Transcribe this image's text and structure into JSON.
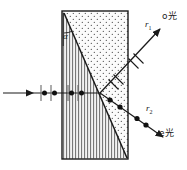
{
  "figure": {
    "type": "optics-ray-diagram",
    "colors": {
      "stroke": "#1a1a1a",
      "background": "#ffffff",
      "vertical_hatch": "#555555",
      "stipple": "#444444"
    }
  },
  "crystal": {
    "name": "birefringent-crystal",
    "left": 62,
    "top": 11,
    "right": 128,
    "bottom": 159,
    "regions": [
      {
        "name": "optic-axis-region-upper-right",
        "fill": "stipple"
      },
      {
        "name": "optic-axis-region-lower-left",
        "fill": "vertical-lines"
      }
    ],
    "diagonal": {
      "x1": 64,
      "y1": 13,
      "x2": 127,
      "y2": 158
    }
  },
  "angle": {
    "label": "α",
    "name": "angle-alpha",
    "x": 64,
    "y": 37
  },
  "incident_ray": {
    "name": "incident-unpolarized-ray",
    "x1": 3,
    "y1": 93,
    "x2": 100,
    "y2": 93,
    "arrow_at": 32,
    "polarization": "unpolarized",
    "markers": [
      "bar",
      "dot",
      "dot",
      "bar",
      "bar",
      "dot",
      "dot",
      "bar"
    ]
  },
  "rays": [
    {
      "id": "r1",
      "name": "ordinary-ray",
      "label": "r",
      "sub": "1",
      "light_label": "o光",
      "polarization": "perpendicular-ticks",
      "label_x": 146,
      "label_y": 24,
      "light_x": 163,
      "light_y": 17
    },
    {
      "id": "r2",
      "name": "extraordinary-ray",
      "label": "r",
      "sub": "2",
      "light_label": "e光",
      "polarization": "dots",
      "label_x": 147,
      "label_y": 108,
      "light_x": 160,
      "light_y": 133
    }
  ]
}
